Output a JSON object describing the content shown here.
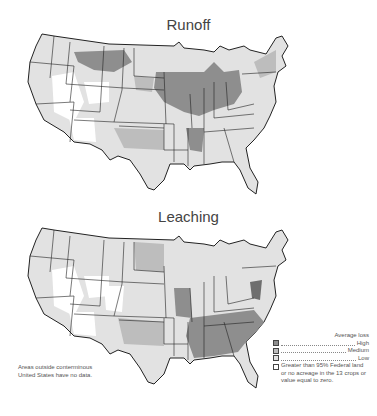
{
  "maps": [
    {
      "title": "Runoff"
    },
    {
      "title": "Leaching"
    }
  ],
  "note": {
    "line1": "Areas outside conterminous",
    "line2": "United States have no data."
  },
  "legend": {
    "title": "Average loss",
    "items": [
      {
        "label": "High",
        "color": "#8e8e8e"
      },
      {
        "label": "Medium",
        "color": "#bdbdbd"
      },
      {
        "label": "Low",
        "color": "#e2e2e2"
      },
      {
        "label": "Greater than 95% Federal land or no acreage in the 13 crops or value equal to zero.",
        "color": "#ffffff"
      }
    ],
    "item4_lines": [
      "Greater than 95% Federal land",
      "or no acreage in the 13 crops or",
      "value equal to zero."
    ]
  },
  "colors": {
    "high": "#8e8e8e",
    "medium": "#bdbdbd",
    "low": "#e2e2e2",
    "none": "#ffffff",
    "border": "#222222"
  }
}
